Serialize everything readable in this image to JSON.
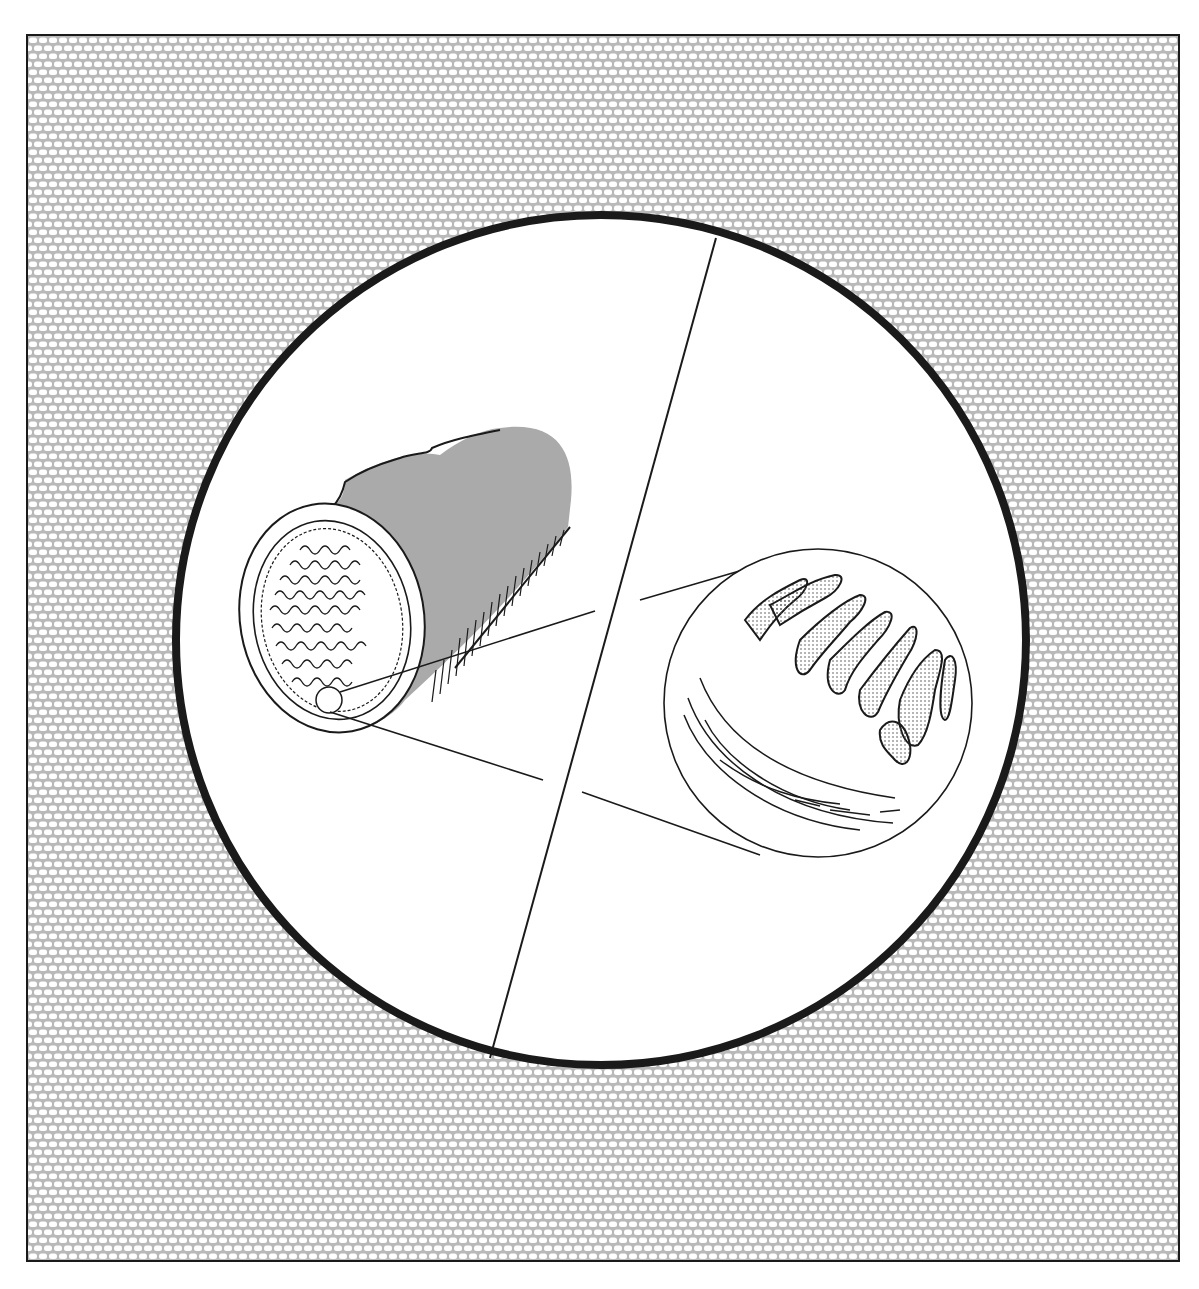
{
  "figure": {
    "colors": {
      "frame_border": "#1a1a1a",
      "background_texture_mortar": "#b9b9b9",
      "background_texture_cell": "#ffffff",
      "tube_fill": "#aaaaaa",
      "line": "#1a1a1a"
    },
    "elements": {
      "main_circle": {
        "cx": 601,
        "cy": 640,
        "r": 425,
        "stroke_width": 8
      },
      "divider_line": {
        "x1": 716,
        "y1": 238,
        "x2": 490,
        "y2": 1058
      },
      "tube": {
        "end_cx": 332,
        "end_cy": 617,
        "end_rx": 92,
        "end_ry": 116
      },
      "magnified_inset": {
        "cx": 818,
        "cy": 703,
        "r": 154
      }
    },
    "caption": ""
  }
}
